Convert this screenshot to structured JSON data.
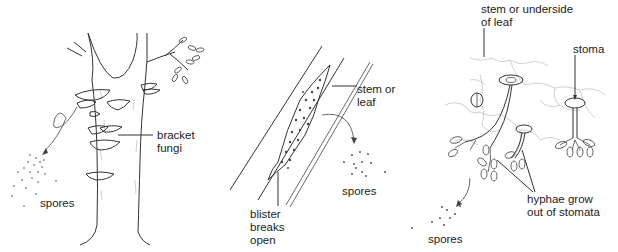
{
  "panels": [
    {
      "id": "bracket-fungi",
      "labels": {
        "fungi": "bracket\nfungi",
        "spores": "spores"
      }
    },
    {
      "id": "blister",
      "labels": {
        "stem": "stem or\nleaf",
        "spores": "spores",
        "blister": "blister\nbreaks\nopen"
      }
    },
    {
      "id": "stomata",
      "labels": {
        "surface": "stem or underside\nof leaf",
        "stoma": "stoma",
        "hyphae": "hyphae grow\nout of stomata",
        "spores": "spores"
      }
    }
  ],
  "colors": {
    "ink": "#222222",
    "background": "#ffffff"
  }
}
